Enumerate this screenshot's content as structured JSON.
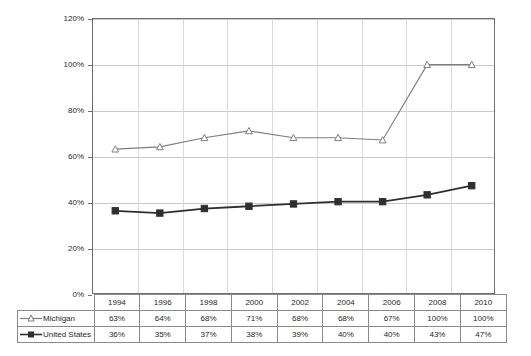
{
  "chart_data": {
    "type": "line",
    "title": "",
    "xlabel": "",
    "ylabel": "",
    "ylim": [
      0,
      120
    ],
    "ytick_labels": [
      "0%",
      "20%",
      "40%",
      "60%",
      "80%",
      "100%",
      "120%"
    ],
    "ytick_values": [
      0,
      20,
      40,
      60,
      80,
      100,
      120
    ],
    "grid": true,
    "legend_position": "table-left",
    "categories": [
      "1994",
      "1996",
      "1998",
      "2000",
      "2002",
      "2004",
      "2006",
      "2008",
      "2010"
    ],
    "series": [
      {
        "name": "Michigan",
        "marker": "open-triangle",
        "color": "#7d7d7d",
        "values": [
          63,
          64,
          68,
          71,
          68,
          68,
          67,
          100,
          100
        ],
        "labels": [
          "63%",
          "64%",
          "68%",
          "71%",
          "68%",
          "68%",
          "67%",
          "100%",
          "100%"
        ]
      },
      {
        "name": "United States",
        "marker": "filled-square",
        "color": "#2f2f2f",
        "values": [
          36,
          35,
          37,
          38,
          39,
          40,
          40,
          43,
          47
        ],
        "labels": [
          "36%",
          "35%",
          "37%",
          "38%",
          "39%",
          "40%",
          "40%",
          "43%",
          "47%"
        ]
      }
    ]
  },
  "table": {
    "header_row": [
      "1994",
      "1996",
      "1998",
      "2000",
      "2002",
      "2004",
      "2006",
      "2008",
      "2010"
    ],
    "rows": [
      {
        "label": "Michigan",
        "marker": "open-triangle",
        "cells": [
          "63%",
          "64%",
          "68%",
          "71%",
          "68%",
          "68%",
          "67%",
          "100%",
          "100%"
        ]
      },
      {
        "label": "United States",
        "marker": "filled-square",
        "cells": [
          "36%",
          "35%",
          "37%",
          "38%",
          "39%",
          "40%",
          "40%",
          "43%",
          "47%"
        ]
      }
    ]
  },
  "colors": {
    "michigan_line": "#7d7d7d",
    "us_line": "#2f2f2f",
    "gridline": "#c9c9c9",
    "frame": "#6f6f6f",
    "table_border": "#8a8a8a",
    "text": "#1f1f1f"
  }
}
